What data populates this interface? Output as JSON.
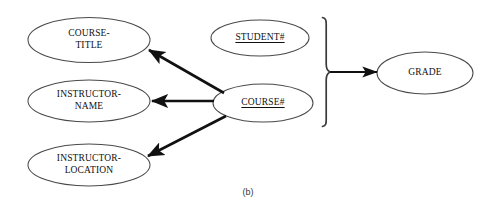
{
  "figure": {
    "caption": "(b)",
    "type": "functional-dependency-diagram"
  },
  "colors": {
    "background": "#ffffff",
    "ellipse_stroke": "#4a4a4a",
    "arrow": "#111111",
    "brace": "#3a3a3a",
    "text": "#101010",
    "caption_text": "#3a3a3a"
  },
  "nodes": [
    {
      "id": "course-title",
      "label": "COURSE-\nTITLE",
      "is_key": false,
      "cx": 89,
      "cy": 40,
      "rx": 61,
      "ry": 22.5
    },
    {
      "id": "instructor-name",
      "label": "INSTRUCTOR-\nNAME",
      "is_key": false,
      "cx": 89,
      "cy": 101,
      "rx": 61,
      "ry": 21
    },
    {
      "id": "instructor-location",
      "label": "INSTRUCTOR-\nLOCATION",
      "is_key": false,
      "cx": 89,
      "cy": 165,
      "rx": 61,
      "ry": 21
    },
    {
      "id": "student-number",
      "label": "STUDENT#",
      "is_key": true,
      "cx": 260,
      "cy": 38,
      "rx": 49,
      "ry": 18
    },
    {
      "id": "course-number",
      "label": "COURSE#",
      "is_key": true,
      "cx": 263,
      "cy": 103,
      "rx": 50,
      "ry": 19
    },
    {
      "id": "grade",
      "label": "GRADE",
      "is_key": false,
      "cx": 425,
      "cy": 73,
      "rx": 48,
      "ry": 21
    }
  ],
  "arrows": [
    {
      "id": "course-number-to-course-title",
      "from": "course-number",
      "to": "course-title",
      "x1": 224,
      "y1": 93,
      "x2": 147,
      "y2": 49,
      "width": 2.6
    },
    {
      "id": "course-number-to-instructor-name",
      "from": "course-number",
      "to": "instructor-name",
      "x1": 214,
      "y1": 101,
      "x2": 150,
      "y2": 101,
      "width": 2.6
    },
    {
      "id": "course-number-to-instructor-location",
      "from": "course-number",
      "to": "instructor-location",
      "x1": 226,
      "y1": 116,
      "x2": 146,
      "y2": 157,
      "width": 2.6
    },
    {
      "id": "brace-to-grade",
      "from": "brace-group",
      "to": "grade",
      "x1": 330,
      "y1": 72,
      "x2": 375,
      "y2": 72,
      "width": 2.2
    }
  ],
  "brace": {
    "id": "composite-key-brace",
    "orientation": "right",
    "x": 322,
    "top": 17,
    "bottom": 127,
    "apex_x": 330,
    "apex_y": 72,
    "groups": [
      "student-number",
      "course-number"
    ],
    "determines": "grade"
  }
}
